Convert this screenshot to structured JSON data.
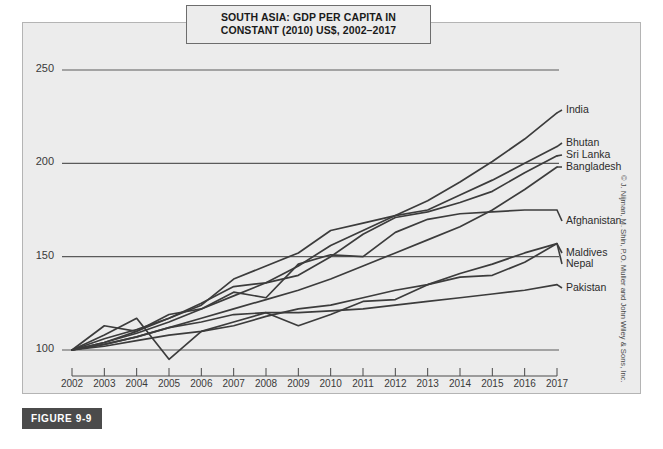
{
  "figure": {
    "badge": "FIGURE 9-9",
    "credit": "© J. Nijman, M. Shin, P.O. Muller and John Wiley & Sons, Inc."
  },
  "colors": {
    "panel_background": "#ececec",
    "panel_border": "#b4b4b4",
    "line": "#3c3c3c",
    "grid": "#5a5a5a",
    "axis_text": "#3a3a3a",
    "badge_background": "#4b4b4b",
    "badge_text": "#ffffff"
  },
  "chart_data": {
    "type": "line",
    "title": "SOUTH ASIA: GDP PER CAPITA IN CONSTANT (2010) US$, 2002–2017",
    "title_line1": "SOUTH ASIA: GDP PER CAPITA IN",
    "title_line2": "CONSTANT (2010) US$, 2002–2017",
    "xlabel": "",
    "ylabel": "",
    "grid": true,
    "legend_position": "right-inline",
    "xlim": [
      2002,
      2017
    ],
    "ylim": [
      90,
      260
    ],
    "yticks": [
      100,
      150,
      200,
      250
    ],
    "ytick_labels": [
      "100",
      "150",
      "200",
      "250"
    ],
    "x": [
      2002,
      2003,
      2004,
      2005,
      2006,
      2007,
      2008,
      2009,
      2010,
      2011,
      2012,
      2013,
      2014,
      2015,
      2016,
      2017
    ],
    "xtick_labels": [
      "2002",
      "2003",
      "2004",
      "2005",
      "2006",
      "2007",
      "2008",
      "2009",
      "2010",
      "2011",
      "2012",
      "2013",
      "2014",
      "2015",
      "2016",
      "2017"
    ],
    "series": [
      {
        "name": "India",
        "values": [
          100,
          104,
          110,
          117,
          125,
          134,
          136,
          145,
          156,
          164,
          172,
          180,
          190,
          201,
          213,
          227
        ]
      },
      {
        "name": "Bhutan",
        "values": [
          100,
          106,
          111,
          117,
          124,
          138,
          145,
          152,
          164,
          168,
          172,
          175,
          183,
          191,
          200,
          209
        ]
      },
      {
        "name": "Sri Lanka",
        "values": [
          100,
          104,
          109,
          115,
          122,
          129,
          136,
          140,
          150,
          162,
          171,
          174,
          179,
          185,
          195,
          204
        ]
      },
      {
        "name": "Bangladesh",
        "values": [
          100,
          103,
          107,
          112,
          117,
          122,
          127,
          132,
          138,
          145,
          152,
          159,
          166,
          175,
          186,
          198
        ]
      },
      {
        "name": "Afghanistan",
        "values": [
          100,
          113,
          110,
          119,
          122,
          131,
          128,
          146,
          151,
          150,
          163,
          170,
          173,
          174,
          175,
          175
        ]
      },
      {
        "name": "Maldives",
        "values": [
          100,
          108,
          117,
          95,
          110,
          115,
          120,
          113,
          119,
          126,
          127,
          135,
          141,
          146,
          152,
          157
        ]
      },
      {
        "name": "Nepal",
        "values": [
          100,
          102,
          105,
          108,
          110,
          113,
          118,
          122,
          124,
          128,
          132,
          135,
          139,
          140,
          147,
          157
        ]
      },
      {
        "name": "Pakistan",
        "values": [
          100,
          103,
          107,
          112,
          115,
          119,
          120,
          120,
          121,
          122,
          124,
          126,
          128,
          130,
          132,
          135
        ]
      }
    ],
    "series_label_positions": [
      {
        "name": "India",
        "left": 566,
        "top": 103
      },
      {
        "name": "Bhutan",
        "left": 566,
        "top": 136
      },
      {
        "name": "Sri Lanka",
        "left": 566,
        "top": 148
      },
      {
        "name": "Bangladesh",
        "left": 566,
        "top": 160
      },
      {
        "name": "Afghanistan",
        "left": 566,
        "top": 214
      },
      {
        "name": "Maldives",
        "left": 566,
        "top": 246
      },
      {
        "name": "Nepal",
        "left": 566,
        "top": 257
      },
      {
        "name": "Pakistan",
        "left": 566,
        "top": 281
      }
    ]
  }
}
